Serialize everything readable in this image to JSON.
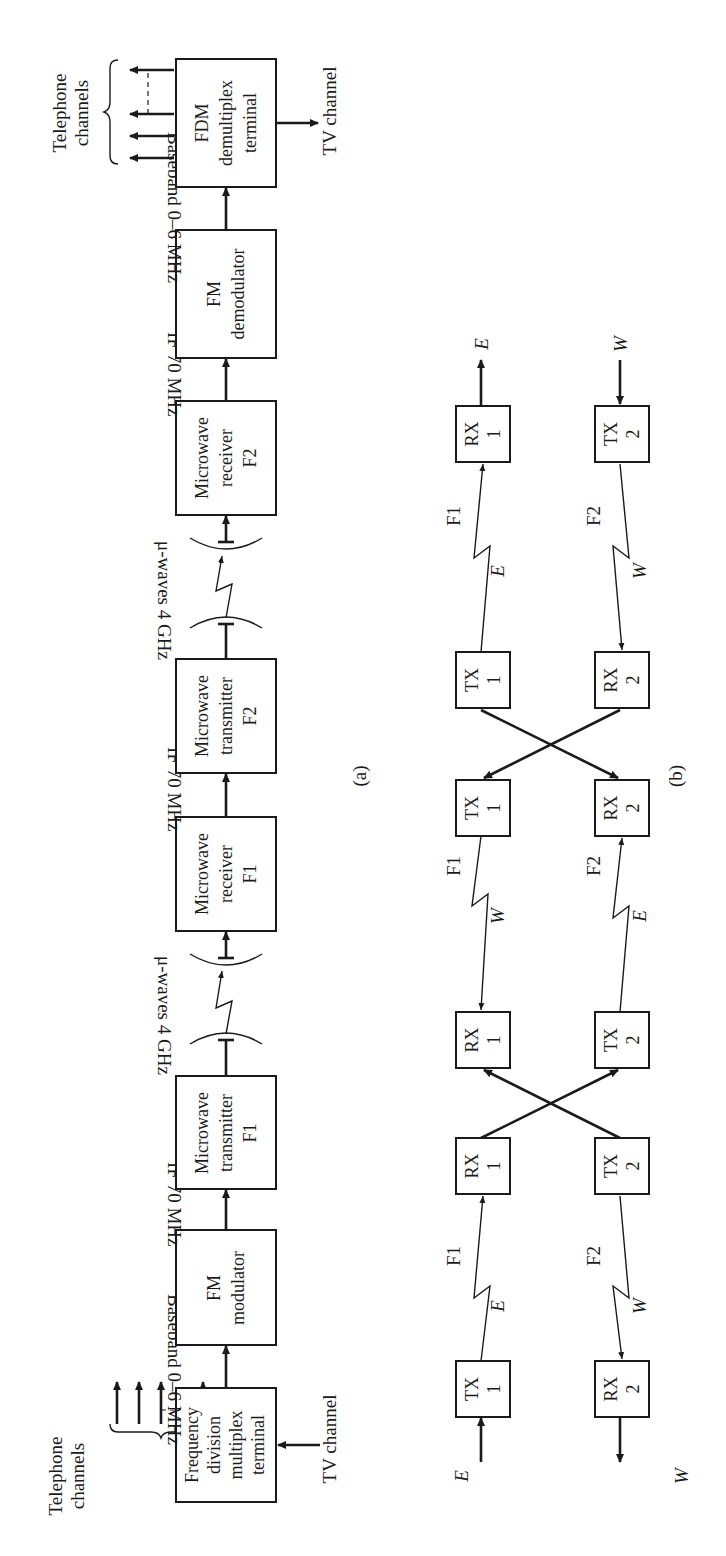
{
  "figure": {
    "orientation": "rotated 90 degrees counter-clockwise",
    "part_a": {
      "label": "(a)",
      "input": {
        "telephone_label_1": "Telephone",
        "telephone_label_2": "channels",
        "tv_label": "TV channel"
      },
      "blocks": [
        {
          "id": "fdm_mux",
          "lines": [
            "Frequency",
            "division",
            "multiplex",
            "terminal"
          ]
        },
        {
          "id": "fm_mod",
          "lines": [
            "FM",
            "modulator"
          ]
        },
        {
          "id": "tx_f1",
          "lines": [
            "Microwave",
            "transmitter",
            "F1"
          ]
        },
        {
          "id": "rx_f1",
          "lines": [
            "Microwave",
            "receiver",
            "F1"
          ]
        },
        {
          "id": "tx_f2",
          "lines": [
            "Microwave",
            "transmitter",
            "F2"
          ]
        },
        {
          "id": "rx_f2",
          "lines": [
            "Microwave",
            "receiver",
            "F2"
          ]
        },
        {
          "id": "fm_demod",
          "lines": [
            "FM",
            "demodulator"
          ]
        },
        {
          "id": "fdm_demux",
          "lines": [
            "FDM",
            "demultiplex",
            "terminal"
          ]
        }
      ],
      "links": [
        "Baseband 0–6 MHz",
        "IF 70 MHz",
        "μ-waves 4 GHz",
        "IF 70 MHz",
        "μ-waves 4 GHz",
        "IF 70 MHz",
        "Baseband 0–6 MHz"
      ],
      "output": {
        "telephone_label_1": "Telephone",
        "telephone_label_2": "channels",
        "tv_label": "TV channel"
      }
    },
    "part_b": {
      "label": "(b)",
      "terminal_left": {
        "top": "E",
        "bottom": "W"
      },
      "terminal_right": {
        "top": "E",
        "bottom": "W"
      },
      "columns": [
        {
          "top": [
            "TX",
            "1"
          ],
          "bottom": [
            "RX",
            "2"
          ]
        },
        {
          "top": [
            "RX",
            "1"
          ],
          "bottom": [
            "TX",
            "2"
          ]
        },
        {
          "top": [
            "RX",
            "1"
          ],
          "bottom": [
            "TX",
            "2"
          ]
        },
        {
          "top": [
            "TX",
            "1"
          ],
          "bottom": [
            "RX",
            "2"
          ]
        },
        {
          "top": [
            "TX",
            "1"
          ],
          "bottom": [
            "RX",
            "2"
          ]
        },
        {
          "top": [
            "RX",
            "1"
          ],
          "bottom": [
            "TX",
            "2"
          ]
        }
      ],
      "hops": [
        {
          "top_dir": "E",
          "top_freq": "F1",
          "bottom_dir": "W",
          "bottom_freq": "F2"
        },
        {
          "top_dir": "W",
          "top_freq": "F1",
          "bottom_dir": "E",
          "bottom_freq": "F2"
        },
        {
          "top_dir": "E",
          "top_freq": "F1",
          "bottom_dir": "W",
          "bottom_freq": "F2"
        }
      ]
    }
  }
}
